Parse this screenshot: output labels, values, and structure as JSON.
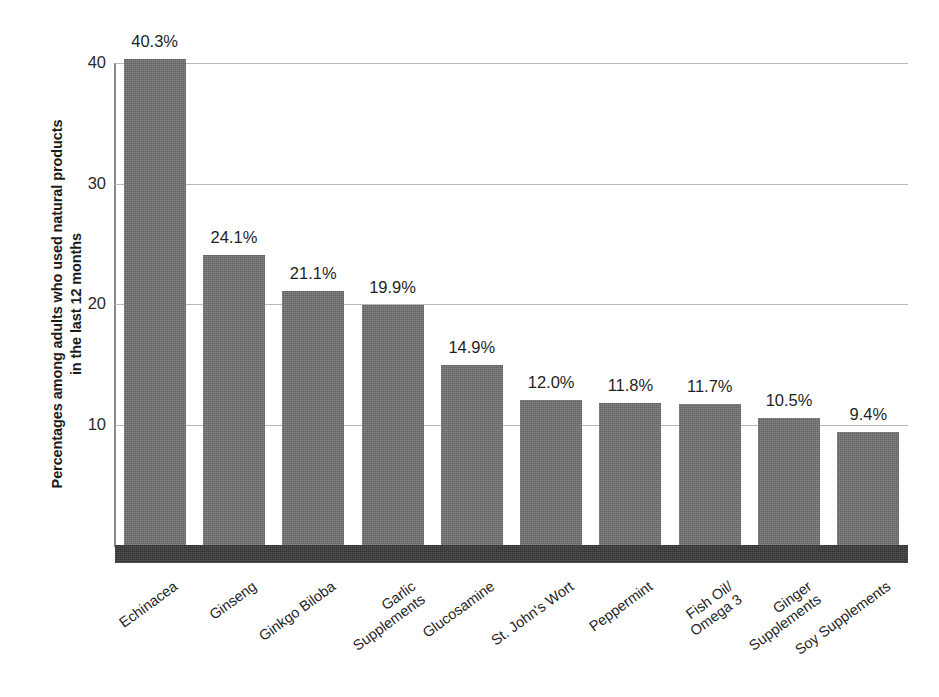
{
  "chart_data": {
    "type": "bar",
    "title": "",
    "subtitle": "",
    "xlabel": "",
    "ylabel": "Percentages among adults who used natural products\nin the last 12 months",
    "ylim": [
      0,
      40
    ],
    "yticks": [
      10,
      20,
      30,
      40
    ],
    "ytick_labels": [
      "10",
      "20",
      "30",
      "40"
    ],
    "grid": true,
    "legend": false,
    "orientation": "vertical",
    "categories": [
      "Echinacea",
      "Ginseng",
      "Ginkgo Biloba",
      "Garlic\nSupplements",
      "Glucosamine",
      "St. John's Wort",
      "Peppermint",
      "Fish Oil/\nOmega 3",
      "Ginger\nSupplements",
      "Soy Supplements"
    ],
    "values": [
      40.3,
      24.1,
      21.1,
      19.9,
      14.9,
      12.0,
      11.8,
      11.7,
      10.5,
      9.4
    ],
    "data_labels": [
      "40.3%",
      "24.1%",
      "21.1%",
      "19.9%",
      "14.9%",
      "12.0%",
      "11.8%",
      "11.7%",
      "10.5%",
      "9.4%"
    ],
    "unit": "%",
    "colors": {
      "bar_fill": "#6e6e6e",
      "baseline_band": "#3b3b3b",
      "gridline": "#b9b9b9",
      "axis_line": "#8a8a8a",
      "text": "#1f1f1f",
      "background": "#ffffff"
    }
  }
}
